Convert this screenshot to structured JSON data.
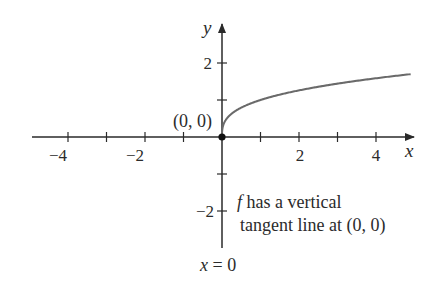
{
  "chart_data": {
    "type": "line",
    "title": "",
    "function": "f(x) = x^(1/3)",
    "xlabel": "x",
    "ylabel": "y",
    "xlim": [
      -4.9,
      4.7
    ],
    "ylim": [
      -3,
      3
    ],
    "grid": false,
    "x_ticks": [
      -4,
      -3,
      -2,
      -1,
      1,
      2,
      3,
      4
    ],
    "x_tick_labels": [
      {
        "value": -4,
        "label": "−4"
      },
      {
        "value": -2,
        "label": "−2"
      },
      {
        "value": 2,
        "label": "2"
      },
      {
        "value": 4,
        "label": "4"
      }
    ],
    "y_ticks": [
      -2,
      -1,
      1,
      2
    ],
    "y_tick_labels": [
      {
        "value": 2,
        "label": "2"
      },
      {
        "value": -2,
        "label": "−2"
      }
    ],
    "series": [
      {
        "name": "f",
        "color": "#6a6a6a",
        "x": [
          -4.9,
          -4,
          -3,
          -2,
          -1,
          -0.5,
          -0.1,
          -0.01,
          0,
          0.01,
          0.1,
          0.5,
          1,
          2,
          3,
          4,
          4.7
        ],
        "y": [
          -1.7,
          -1.59,
          -1.44,
          -1.26,
          -1.0,
          -0.79,
          -0.46,
          -0.22,
          0,
          0.22,
          0.46,
          0.79,
          1.0,
          1.26,
          1.44,
          1.59,
          1.67
        ]
      }
    ],
    "points": [
      {
        "x": 0,
        "y": 0,
        "label": "(0, 0)"
      }
    ],
    "annotations": [
      {
        "text_italic": "f",
        "text": " has a vertical",
        "line": 1
      },
      {
        "text": "tangent line at (0, 0)",
        "line": 2
      },
      {
        "text_italic": "x",
        "text": " = 0",
        "position": "below y-axis"
      }
    ],
    "colors": {
      "axis": "#2a2a2a",
      "curve": "#6a6a6a",
      "point": "#111111"
    }
  },
  "labels": {
    "x_axis": "x",
    "y_axis": "y",
    "point_label": "(0, 0)",
    "annot_f": "f",
    "annot_line1_rest": " has a vertical",
    "annot_line2": "tangent line at (0, 0)",
    "asymptote_x": "x",
    "asymptote_rest": " = 0",
    "tick_neg4": "−4",
    "tick_neg2": "−2",
    "tick_2": "2",
    "tick_4": "4",
    "ytick_2": "2",
    "ytick_neg2": "−2"
  }
}
